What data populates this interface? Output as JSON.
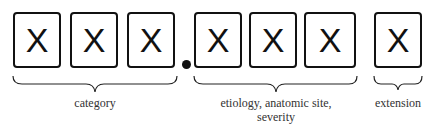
{
  "diagram": {
    "title": "",
    "boxes": [
      {
        "char": "X",
        "group": "category"
      },
      {
        "char": "X",
        "group": "category"
      },
      {
        "char": "X",
        "group": "category"
      },
      {
        "char": "X",
        "group": "etiology"
      },
      {
        "char": "X",
        "group": "etiology"
      },
      {
        "char": "X",
        "group": "etiology"
      },
      {
        "char": "X",
        "group": "extension"
      }
    ],
    "separator": "•",
    "labels": {
      "category": "category",
      "etiology_line1": "etiology, anatomic site,",
      "etiology_line2": "severity",
      "extension": "extension"
    }
  }
}
